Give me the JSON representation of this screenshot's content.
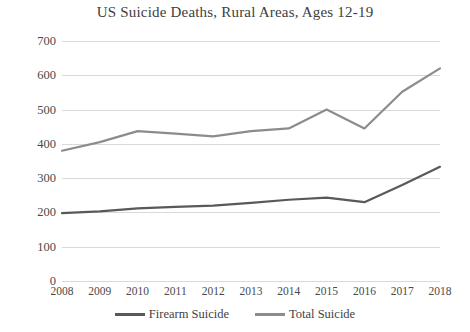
{
  "chart_data": {
    "type": "line",
    "title": "US Suicide Deaths, Rural Areas, Ages 12-19",
    "xlabel": "",
    "ylabel": "",
    "categories": [
      "2008",
      "2009",
      "2010",
      "2011",
      "2012",
      "2013",
      "2014",
      "2015",
      "2016",
      "2017",
      "2018"
    ],
    "series": [
      {
        "name": "Firearm Suicide",
        "color": "#595959",
        "values": [
          198,
          203,
          212,
          216,
          220,
          228,
          237,
          243,
          230,
          280,
          333
        ]
      },
      {
        "name": "Total Suicide",
        "color": "#8c8c8c",
        "values": [
          380,
          405,
          437,
          430,
          422,
          437,
          445,
          500,
          445,
          552,
          620
        ]
      }
    ],
    "ylim": [
      0,
      700
    ],
    "ytick_step": 100,
    "yticks": [
      "700",
      "600",
      "500",
      "400",
      "300",
      "200",
      "100",
      "0"
    ],
    "grid": true,
    "legend_position": "bottom"
  },
  "legend": {
    "items": [
      {
        "label": "Firearm Suicide",
        "color": "#595959"
      },
      {
        "label": "Total Suicide",
        "color": "#8c8c8c"
      }
    ]
  }
}
